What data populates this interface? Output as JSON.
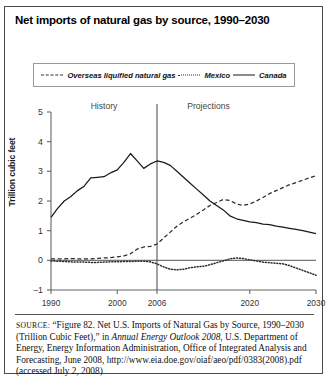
{
  "figure": {
    "title": "Net imports of natural gas by source, 1990–2030"
  },
  "legend": {
    "entries": [
      {
        "label": "Overseas liquified natural gas",
        "style": "dashed",
        "color": "#2a2a2a",
        "icon": "dashed-line-icon"
      },
      {
        "label": "Mexico",
        "style": "dotted",
        "color": "#2a2a2a",
        "icon": "dotted-line-icon"
      },
      {
        "label": "Canada",
        "style": "solid",
        "color": "#1a1a1a",
        "icon": "solid-line-icon"
      }
    ]
  },
  "annotations": {
    "history": "History",
    "projections": "Projections",
    "divider_year": 2006
  },
  "source": {
    "label": "SOURCE:",
    "text_1": " “Figure 82. Net U.S. Imports of Natural Gas by Source, 1990–2030 (Trillion Cubic Feet),” in ",
    "italic_1": "Annual Energy Outlook 2008",
    "text_2": ", U.S. Department of Energy, Energy Information Administration, Office of Integrated Analysis and Forecasting, June 2008, http://www.eia.doe.gov/oiaf/aeo/pdf/0383(2008).pdf (accessed July 2, 2008)"
  },
  "chart_data": {
    "type": "line",
    "title": "Net imports of natural gas by source, 1990–2030",
    "xlabel": "",
    "ylabel": "Trillion cubic feet",
    "xlim": [
      1990,
      2030
    ],
    "ylim": [
      -1,
      5
    ],
    "yticks": [
      5,
      4,
      3,
      2,
      1,
      0,
      -1
    ],
    "xticks": [
      1990,
      2000,
      2006,
      2020,
      2030
    ],
    "grid": false,
    "legend_position": "top",
    "x": [
      1990,
      1991,
      1992,
      1993,
      1994,
      1995,
      1996,
      1997,
      1998,
      1999,
      2000,
      2001,
      2002,
      2003,
      2004,
      2005,
      2006,
      2007,
      2008,
      2009,
      2010,
      2011,
      2012,
      2013,
      2014,
      2015,
      2016,
      2017,
      2018,
      2019,
      2020,
      2021,
      2022,
      2023,
      2024,
      2025,
      2026,
      2027,
      2028,
      2029,
      2030
    ],
    "series": [
      {
        "name": "Overseas liquified natural gas",
        "style": "dashed",
        "color": "#2a2a2a",
        "values": [
          0.05,
          0.05,
          0.05,
          0.06,
          0.05,
          0.05,
          0.05,
          0.07,
          0.08,
          0.09,
          0.12,
          0.15,
          0.22,
          0.38,
          0.45,
          0.47,
          0.55,
          0.75,
          0.95,
          1.15,
          1.3,
          1.42,
          1.55,
          1.7,
          1.85,
          1.95,
          2.05,
          2.02,
          1.9,
          1.85,
          1.9,
          2.0,
          2.12,
          2.25,
          2.35,
          2.45,
          2.55,
          2.62,
          2.7,
          2.78,
          2.85
        ]
      },
      {
        "name": "Mexico",
        "style": "dotted",
        "color": "#2a2a2a",
        "values": [
          -0.02,
          -0.03,
          -0.04,
          -0.05,
          -0.06,
          -0.06,
          -0.07,
          -0.07,
          -0.06,
          -0.05,
          -0.05,
          -0.04,
          -0.04,
          -0.03,
          -0.03,
          -0.05,
          -0.12,
          -0.22,
          -0.3,
          -0.32,
          -0.3,
          -0.25,
          -0.22,
          -0.2,
          -0.15,
          -0.08,
          -0.02,
          0.05,
          0.08,
          0.06,
          0.02,
          -0.02,
          -0.06,
          -0.08,
          -0.1,
          -0.12,
          -0.18,
          -0.26,
          -0.34,
          -0.42,
          -0.5
        ]
      },
      {
        "name": "Canada",
        "style": "solid",
        "color": "#1a1a1a",
        "values": [
          1.45,
          1.75,
          2.0,
          2.15,
          2.35,
          2.5,
          2.78,
          2.8,
          2.82,
          2.95,
          3.05,
          3.3,
          3.6,
          3.35,
          3.1,
          3.25,
          3.35,
          3.3,
          3.2,
          3.0,
          2.8,
          2.6,
          2.4,
          2.2,
          2.0,
          1.85,
          1.7,
          1.5,
          1.4,
          1.35,
          1.3,
          1.27,
          1.22,
          1.2,
          1.15,
          1.12,
          1.08,
          1.04,
          1.0,
          0.95,
          0.9
        ]
      }
    ]
  }
}
